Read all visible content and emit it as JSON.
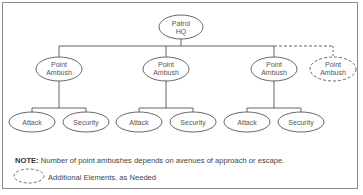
{
  "diagram": {
    "root": {
      "label_line1": "Patrol",
      "label_line2": "HQ"
    },
    "branches": [
      {
        "label_line1": "Point",
        "label_line2": "Ambush",
        "style": "solid",
        "children": [
          {
            "label": "Attack"
          },
          {
            "label": "Security"
          }
        ]
      },
      {
        "label_line1": "Point",
        "label_line2": "Ambush",
        "style": "solid",
        "children": [
          {
            "label": "Attack"
          },
          {
            "label": "Security"
          }
        ]
      },
      {
        "label_line1": "Point",
        "label_line2": "Ambush",
        "style": "solid",
        "children": [
          {
            "label": "Attack"
          },
          {
            "label": "Security"
          }
        ]
      },
      {
        "label_line1": "Point",
        "label_line2": "Ambush",
        "style": "dashed",
        "children": []
      }
    ]
  },
  "note": {
    "prefix": "NOTE:",
    "text": " Number of point ambushes depends on avenues of approach or escape."
  },
  "legend": {
    "dashed_ellipse_label": "Additional Elements, as Needed"
  },
  "colors": {
    "line": "#555555",
    "text": "#555555",
    "border": "#8a8a8a"
  }
}
